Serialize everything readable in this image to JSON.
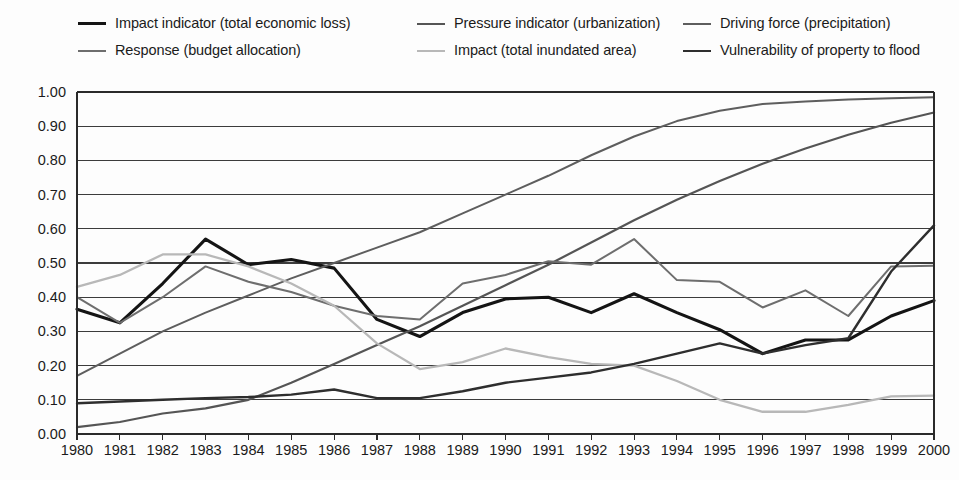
{
  "legend": {
    "rows": [
      [
        {
          "label": "Impact indicator (total economic loss)",
          "color": "#141414",
          "width": 3.1,
          "key": "impact_economic_loss"
        },
        {
          "label": "Pressure indicator (urbanization)",
          "color": "#555555",
          "width": 2.2,
          "key": "pressure_urbanization"
        },
        {
          "label": "Driving force (precipitation)",
          "color": "#5e5e5e",
          "width": 2.0,
          "key": "driving_force_precipitation"
        }
      ],
      [
        {
          "label": "Response (budget allocation)",
          "color": "#6e6e6e",
          "width": 2.0,
          "key": "response_budget_allocation"
        },
        {
          "label": "Impact (total inundated area)",
          "color": "#b8b8b8",
          "width": 2.3,
          "key": "impact_inundated_area"
        },
        {
          "label": "Vulnerability of property to flood",
          "color": "#2e2e2e",
          "width": 2.4,
          "key": "vulnerability_property_flood"
        }
      ]
    ],
    "column_x": [
      78,
      417,
      683
    ]
  },
  "chart_data": {
    "type": "line",
    "title": "",
    "xlabel": "",
    "ylabel": "",
    "x": [
      1980,
      1981,
      1982,
      1983,
      1984,
      1985,
      1986,
      1987,
      1988,
      1989,
      1990,
      1991,
      1992,
      1993,
      1994,
      1995,
      1996,
      1997,
      1998,
      1999,
      2000
    ],
    "categories": [
      "1980",
      "1981",
      "1982",
      "1983",
      "1984",
      "1985",
      "1986",
      "1987",
      "1988",
      "1989",
      "1990",
      "1991",
      "1992",
      "1993",
      "1994",
      "1995",
      "1996",
      "1997",
      "1998",
      "1999",
      "2000"
    ],
    "ylim": [
      0.0,
      1.0
    ],
    "yticks": [
      0.0,
      0.1,
      0.2,
      0.3,
      0.4,
      0.5,
      0.6,
      0.7,
      0.8,
      0.9,
      1.0
    ],
    "ytick_labels": [
      "0.00",
      "0.10",
      "0.20",
      "0.30",
      "0.40",
      "0.50",
      "0.60",
      "0.70",
      "0.80",
      "0.90",
      "1.00"
    ],
    "grid": true,
    "legend_position": "top",
    "series": [
      {
        "name": "Impact indicator (total economic loss)",
        "key": "impact_economic_loss",
        "color": "#141414",
        "width": 3.1,
        "values": [
          0.365,
          0.325,
          0.44,
          0.57,
          0.495,
          0.51,
          0.485,
          0.335,
          0.285,
          0.355,
          0.395,
          0.4,
          0.355,
          0.41,
          0.355,
          0.305,
          0.235,
          0.275,
          0.275,
          0.345,
          0.39
        ]
      },
      {
        "name": "Pressure indicator (urbanization)",
        "key": "pressure_urbanization",
        "color": "#555555",
        "width": 2.2,
        "values": [
          0.02,
          0.035,
          0.06,
          0.075,
          0.1,
          0.15,
          0.205,
          0.26,
          0.315,
          0.375,
          0.435,
          0.495,
          0.56,
          0.625,
          0.685,
          0.74,
          0.79,
          0.835,
          0.875,
          0.91,
          0.94
        ]
      },
      {
        "name": "Driving force (precipitation)",
        "key": "driving_force_precipitation",
        "color": "#5e5e5e",
        "width": 2.0,
        "values": [
          0.17,
          0.235,
          0.3,
          0.355,
          0.405,
          0.455,
          0.5,
          0.545,
          0.59,
          0.645,
          0.7,
          0.755,
          0.815,
          0.87,
          0.915,
          0.945,
          0.965,
          0.972,
          0.978,
          0.982,
          0.985
        ]
      },
      {
        "name": "Response (budget allocation)",
        "key": "response_budget_allocation",
        "color": "#6e6e6e",
        "width": 2.0,
        "values": [
          0.4,
          0.325,
          0.4,
          0.49,
          0.445,
          0.415,
          0.375,
          0.345,
          0.335,
          0.44,
          0.465,
          0.505,
          0.495,
          0.57,
          0.45,
          0.445,
          0.37,
          0.42,
          0.345,
          0.49,
          0.492
        ]
      },
      {
        "name": "Impact (total inundated area)",
        "key": "impact_inundated_area",
        "color": "#b8b8b8",
        "width": 2.3,
        "values": [
          0.43,
          0.465,
          0.525,
          0.525,
          0.49,
          0.44,
          0.375,
          0.265,
          0.19,
          0.21,
          0.25,
          0.225,
          0.205,
          0.2,
          0.155,
          0.1,
          0.065,
          0.065,
          0.085,
          0.11,
          0.112
        ]
      },
      {
        "name": "Vulnerability of property to flood",
        "key": "vulnerability_property_flood",
        "color": "#2e2e2e",
        "width": 2.4,
        "values": [
          0.09,
          0.095,
          0.1,
          0.105,
          0.108,
          0.115,
          0.13,
          0.105,
          0.105,
          0.125,
          0.15,
          0.165,
          0.18,
          0.205,
          0.235,
          0.265,
          0.235,
          0.26,
          0.28,
          0.475,
          0.61
        ]
      }
    ]
  },
  "geometry": {
    "plot_left": 77,
    "plot_right": 934,
    "plot_top": 18,
    "plot_bottom": 360,
    "xlabel_y": 381
  }
}
